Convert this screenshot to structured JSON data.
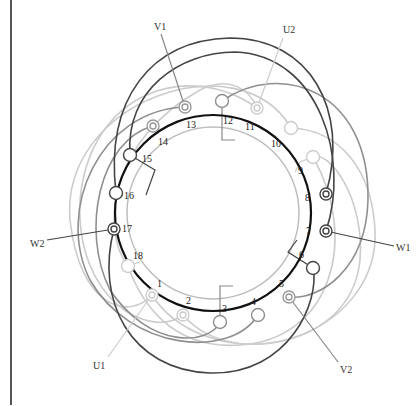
{
  "diagram": {
    "center": [
      213,
      213
    ],
    "main_ring_radius": 98,
    "inner_ring_radius": 86,
    "colors": {
      "phase_W": "#444444",
      "phase_V": "#888888",
      "phase_U": "#c8c8c8",
      "main_ring": "#111111",
      "inner_ring": "#bbbbbb",
      "frame": "#555555"
    },
    "slots": [
      {
        "n": "1",
        "x": 160,
        "y": 283
      },
      {
        "n": "2",
        "x": 189,
        "y": 301
      },
      {
        "n": "3",
        "x": 225,
        "y": 309
      },
      {
        "n": "4",
        "x": 254,
        "y": 302
      },
      {
        "n": "5",
        "x": 282,
        "y": 284
      },
      {
        "n": "6",
        "x": 302,
        "y": 257
      },
      {
        "n": "7",
        "x": 310,
        "y": 232
      },
      {
        "n": "8",
        "x": 309,
        "y": 199
      },
      {
        "n": "9",
        "x": 301,
        "y": 172
      },
      {
        "n": "10",
        "x": 275,
        "y": 145
      },
      {
        "n": "11",
        "x": 249,
        "y": 128
      },
      {
        "n": "12",
        "x": 224,
        "y": 123
      },
      {
        "n": "13",
        "x": 188,
        "y": 127
      },
      {
        "n": "14",
        "x": 159,
        "y": 144
      },
      {
        "n": "15",
        "x": 144,
        "y": 162
      },
      {
        "n": "16",
        "x": 127,
        "y": 197
      },
      {
        "n": "17",
        "x": 121,
        "y": 232
      },
      {
        "n": "18",
        "x": 133,
        "y": 259
      }
    ],
    "terminals": [
      {
        "slot": "13",
        "x": 185,
        "y": 107,
        "style": "double",
        "phase": "V"
      },
      {
        "slot": "14",
        "x": 153,
        "y": 126,
        "style": "double",
        "phase": "V"
      },
      {
        "slot": "15",
        "x": 130,
        "y": 155,
        "style": "open",
        "phase": "W"
      },
      {
        "slot": "16",
        "x": 116,
        "y": 193,
        "style": "open",
        "phase": "W"
      },
      {
        "slot": "17",
        "x": 114,
        "y": 229,
        "style": "double",
        "phase": "W"
      },
      {
        "slot": "18",
        "x": 128,
        "y": 266,
        "style": "open",
        "phase": "U"
      },
      {
        "slot": "1",
        "x": 152,
        "y": 295,
        "style": "double",
        "phase": "U"
      },
      {
        "slot": "2",
        "x": 183,
        "y": 315,
        "style": "double",
        "phase": "U"
      },
      {
        "slot": "3",
        "x": 220,
        "y": 322,
        "style": "open",
        "phase": "V"
      },
      {
        "slot": "4",
        "x": 258,
        "y": 315,
        "style": "open",
        "phase": "V"
      },
      {
        "slot": "5",
        "x": 289,
        "y": 297,
        "style": "double",
        "phase": "V"
      },
      {
        "slot": "6",
        "x": 313,
        "y": 268,
        "style": "open",
        "phase": "W"
      },
      {
        "slot": "7",
        "x": 326,
        "y": 231,
        "style": "double",
        "phase": "W"
      },
      {
        "slot": "8",
        "x": 326,
        "y": 194,
        "style": "double",
        "phase": "W"
      },
      {
        "slot": "9",
        "x": 313,
        "y": 157,
        "style": "open",
        "phase": "U"
      },
      {
        "slot": "10",
        "x": 291,
        "y": 128,
        "style": "open",
        "phase": "U"
      },
      {
        "slot": "11",
        "x": 257,
        "y": 108,
        "style": "double",
        "phase": "U"
      },
      {
        "slot": "12",
        "x": 222,
        "y": 101,
        "style": "open",
        "phase": "V"
      }
    ],
    "leads": [
      {
        "label": "V1",
        "label_x": 156,
        "label_y": 29,
        "line_from": [
          161,
          34
        ],
        "line_to": [
          185,
          107
        ],
        "color": "#888888"
      },
      {
        "label": "U2",
        "label_x": 282,
        "label_y": 32,
        "line_from": [
          283,
          38
        ],
        "line_to": [
          257,
          108
        ],
        "color": "#c8c8c8"
      },
      {
        "label": "W1",
        "label_x": 397,
        "label_y": 251,
        "line_from": [
          394,
          246
        ],
        "line_to": [
          326,
          231
        ],
        "color": "#444444"
      },
      {
        "label": "W2",
        "label_x": 30,
        "label_y": 247,
        "line_from": [
          47,
          240
        ],
        "line_to": [
          114,
          229
        ],
        "color": "#444444"
      },
      {
        "label": "U1",
        "label_x": 95,
        "label_y": 369,
        "line_from": [
          108,
          357
        ],
        "line_to": [
          152,
          295
        ],
        "color": "#c8c8c8"
      },
      {
        "label": "V2",
        "label_x": 340,
        "label_y": 372,
        "line_from": [
          338,
          362
        ],
        "line_to": [
          289,
          297
        ],
        "color": "#888888"
      }
    ]
  }
}
